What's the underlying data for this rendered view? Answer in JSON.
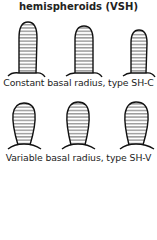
{
  "title": "hemispheroids (VSH)",
  "groups": [
    {
      "caption": "Constant basal radius, type SH-C",
      "shapes": 3
    },
    {
      "caption": "Variable basal radius, type SH-V",
      "shapes": 3
    }
  ]
}
